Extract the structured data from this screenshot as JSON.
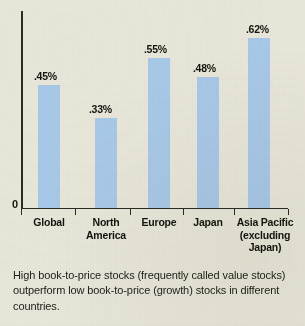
{
  "chart_data": {
    "type": "bar",
    "title": "",
    "xlabel": "",
    "ylabel": "",
    "categories": [
      "Global",
      "North America",
      "Europe",
      "Japan",
      "Asia Pacific (excluding Japan)"
    ],
    "category_lines": [
      [
        "Global"
      ],
      [
        "North",
        "America"
      ],
      [
        "Europe"
      ],
      [
        "Japan"
      ],
      [
        "Asia Pacific",
        "(excluding",
        "Japan)"
      ]
    ],
    "values": [
      0.45,
      0.33,
      0.55,
      0.48,
      0.62
    ],
    "value_labels": [
      ".45%",
      ".33%",
      ".55%",
      ".48%",
      ".62%"
    ],
    "ylim": [
      0,
      0.72
    ],
    "y_tick_labels": [
      "0"
    ],
    "grid": false,
    "legend": null,
    "bar_color": "#a9c9e9",
    "axis_color": "#2b2b26",
    "background_color": "#e9e7da",
    "annotation": "High book-to-price stocks (frequently called value stocks) outperform low book-to-price (growth) stocks in different countries."
  },
  "axis": {
    "zero_label": "0"
  },
  "caption": {
    "text": "High book-to-price stocks (frequently called value stocks) outperform low book-to-price (growth) stocks in different countries."
  }
}
